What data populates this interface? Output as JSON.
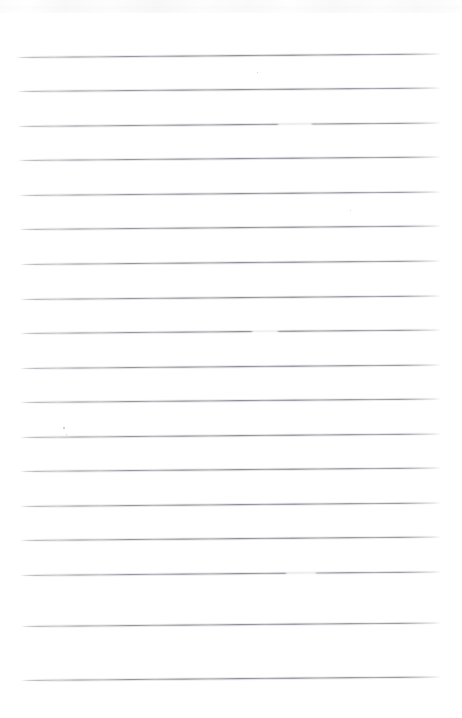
{
  "document": {
    "kind": "scanned-blank-lined-notebook-page",
    "title": "Blank ruled notebook page (scan)",
    "page_width": 462,
    "page_height": 718,
    "background_color": "#ffffff",
    "text_content": "",
    "handwriting_present": false,
    "printed_text_present": false
  },
  "ruling": {
    "style": "horizontal ruled lines, no margin rule",
    "line_color": "#8f8f94",
    "line_count": 18,
    "line_spacing_px": 34.7,
    "first_line_y": 52,
    "last_line_y": 676,
    "line_start_x": 16,
    "line_end_x": 441,
    "skew_degrees": -0.33,
    "lines": [
      {
        "index": 1,
        "y_left": 57.5,
        "y_right": 54.0,
        "x_start": 16,
        "x_end": 441
      },
      {
        "index": 2,
        "y_left": 92.0,
        "y_right": 88.5,
        "x_start": 17,
        "x_end": 441
      },
      {
        "index": 3,
        "y_left": 126.5,
        "y_right": 123.0,
        "x_start": 17,
        "x_end": 441
      },
      {
        "index": 4,
        "y_left": 161.0,
        "y_right": 157.5,
        "x_start": 18,
        "x_end": 441
      },
      {
        "index": 5,
        "y_left": 195.5,
        "y_right": 192.0,
        "x_start": 19,
        "x_end": 441
      },
      {
        "index": 6,
        "y_left": 230.0,
        "y_right": 226.5,
        "x_start": 19,
        "x_end": 441
      },
      {
        "index": 7,
        "y_left": 264.5,
        "y_right": 261.0,
        "x_start": 20,
        "x_end": 441
      },
      {
        "index": 8,
        "y_left": 299.5,
        "y_right": 296.0,
        "x_start": 20,
        "x_end": 441
      },
      {
        "index": 9,
        "y_left": 334.0,
        "y_right": 330.5,
        "x_start": 20,
        "x_end": 441
      },
      {
        "index": 10,
        "y_left": 368.5,
        "y_right": 365.0,
        "x_start": 20,
        "x_end": 441
      },
      {
        "index": 11,
        "y_left": 403.0,
        "y_right": 399.5,
        "x_start": 20,
        "x_end": 441
      },
      {
        "index": 12,
        "y_left": 437.5,
        "y_right": 434.0,
        "x_start": 20,
        "x_end": 441
      },
      {
        "index": 13,
        "y_left": 472.0,
        "y_right": 468.5,
        "x_start": 20,
        "x_end": 441
      },
      {
        "index": 14,
        "y_left": 506.5,
        "y_right": 503.0,
        "x_start": 20,
        "x_end": 441
      },
      {
        "index": 15,
        "y_left": 541.0,
        "y_right": 537.5,
        "x_start": 20,
        "x_end": 441
      },
      {
        "index": 16,
        "y_left": 576.0,
        "y_right": 572.5,
        "x_start": 20,
        "x_end": 441
      },
      {
        "index": 17,
        "y_left": 626.5,
        "y_right": 623.0,
        "x_start": 21,
        "x_end": 441
      },
      {
        "index": 18,
        "y_left": 681.0,
        "y_right": 677.5,
        "x_start": 21,
        "x_end": 441
      }
    ]
  },
  "artifacts": {
    "top_edge_smudge": {
      "present": true,
      "y": 0,
      "height": 13
    },
    "ink_gaps": [
      {
        "on_line": 3,
        "x": 278,
        "width": 34
      },
      {
        "on_line": 9,
        "x": 252,
        "width": 26
      },
      {
        "on_line": 16,
        "x": 286,
        "width": 30
      }
    ],
    "specks": [
      {
        "x": 63,
        "y": 427,
        "size": 1.6
      },
      {
        "x": 66,
        "y": 434,
        "size": 1.2
      },
      {
        "x": 257,
        "y": 72,
        "size": 1.1
      },
      {
        "x": 350,
        "y": 210,
        "size": 0.9
      }
    ]
  }
}
